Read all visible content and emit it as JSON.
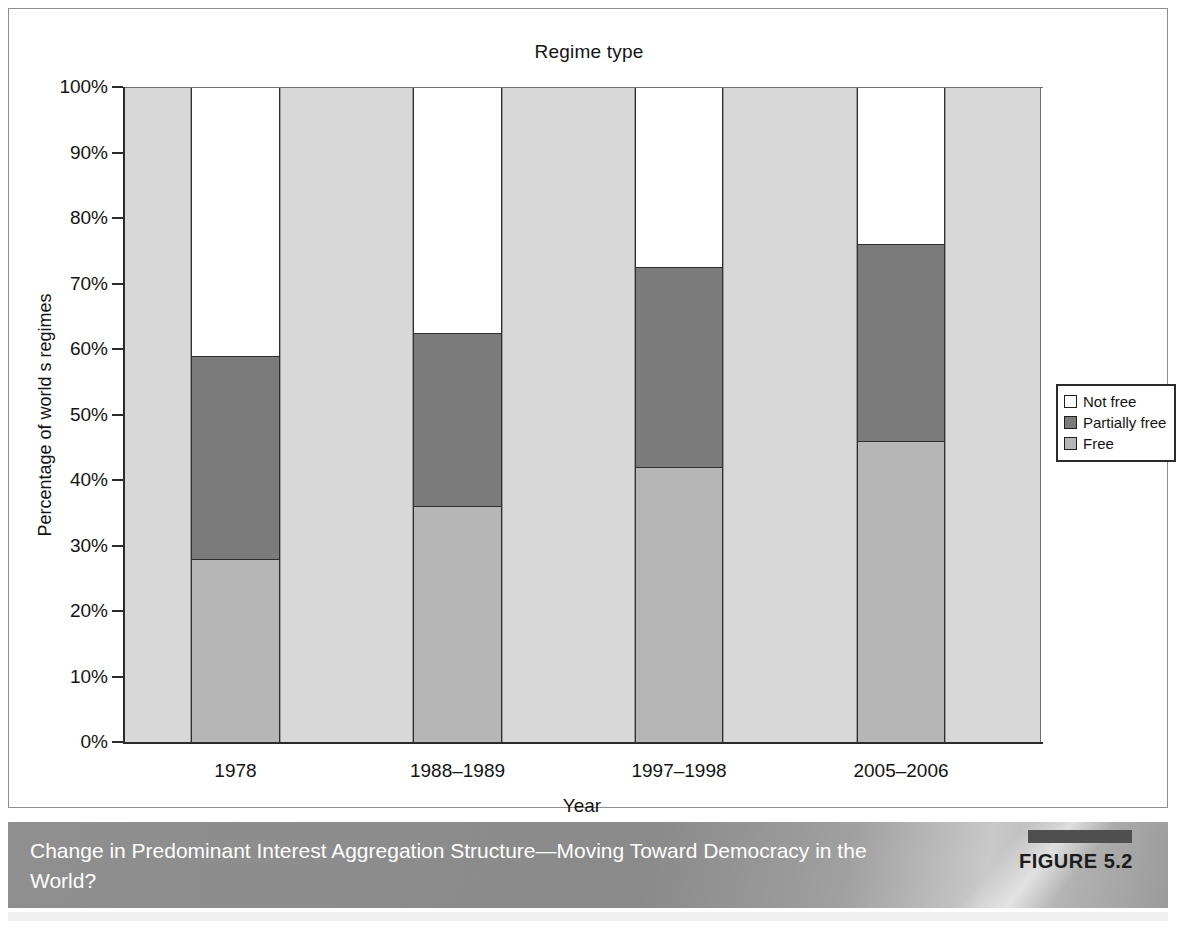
{
  "figure": {
    "caption": "Change in Predominant Interest Aggregation Structure—Moving Toward Democracy in the World?",
    "figure_tag": "FIGURE 5.2"
  },
  "legend": {
    "position": "right",
    "items": [
      {
        "label": "Not free",
        "color": "#ffffff",
        "icon": "legend-swatch-not-free"
      },
      {
        "label": "Partially free",
        "color": "#7b7b7b",
        "icon": "legend-swatch-partially-free"
      },
      {
        "label": "Free",
        "color": "#b6b6b6",
        "icon": "legend-swatch-free"
      }
    ]
  },
  "chart_data": {
    "type": "bar",
    "subtype": "stacked-percentage",
    "title": "Regime type",
    "xlabel": "Year",
    "ylabel": "Percentage of world s regimes",
    "categories": [
      "1978",
      "1988–1989",
      "1997–1998",
      "2005–2006"
    ],
    "series": [
      {
        "name": "Free",
        "color": "#b6b6b6",
        "values": [
          28,
          36,
          42,
          46
        ]
      },
      {
        "name": "Partially free",
        "color": "#7b7b7b",
        "values": [
          31,
          26.5,
          30.5,
          30
        ]
      },
      {
        "name": "Not free",
        "color": "#ffffff",
        "values": [
          41,
          37.5,
          27.5,
          24
        ]
      }
    ],
    "cumulative_tops": {
      "free": [
        28,
        36,
        42,
        46
      ],
      "partially_free": [
        59,
        62.5,
        72.5,
        76
      ],
      "not_free": [
        100,
        100,
        100,
        100
      ]
    },
    "ylim": [
      0,
      100
    ],
    "ytick_values": [
      0,
      10,
      20,
      30,
      40,
      50,
      60,
      70,
      80,
      90,
      100
    ],
    "ytick_labels": [
      "0%",
      "10%",
      "20%",
      "30%",
      "40%",
      "50%",
      "60%",
      "70%",
      "80%",
      "90%",
      "100%"
    ],
    "grid": false,
    "legend_position": "right"
  }
}
